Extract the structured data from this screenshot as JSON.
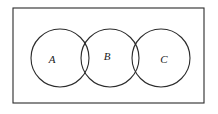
{
  "figure": {
    "type": "venn-diagram",
    "background_color": "#ffffff",
    "stroke_color": "#2b2b2b",
    "label_color": "#1a1a1a",
    "universe": {
      "name": "universal-set-rectangle",
      "x": 13,
      "y": 8,
      "width": 191,
      "height": 95,
      "stroke_width": 1.1,
      "fill": "#ffffff"
    },
    "circles": [
      {
        "label": "A",
        "cx": 60,
        "cy": 58,
        "r": 29,
        "stroke_width": 1.1,
        "label_x": 52,
        "label_y": 60,
        "label_size": 11
      },
      {
        "label": "B",
        "cx": 110,
        "cy": 58,
        "r": 29,
        "stroke_width": 1.1,
        "label_x": 107,
        "label_y": 57,
        "label_size": 11
      },
      {
        "label": "C",
        "cx": 161,
        "cy": 58,
        "r": 29,
        "stroke_width": 1.1,
        "label_x": 164,
        "label_y": 60,
        "label_size": 11
      }
    ],
    "intersections": [
      {
        "name": "A-B",
        "top_x": 86,
        "top_y": 38,
        "bottom_x": 86,
        "bottom_y": 78
      },
      {
        "name": "B-C",
        "top_x": 135,
        "top_y": 39,
        "bottom_x": 135,
        "bottom_y": 78
      }
    ]
  }
}
